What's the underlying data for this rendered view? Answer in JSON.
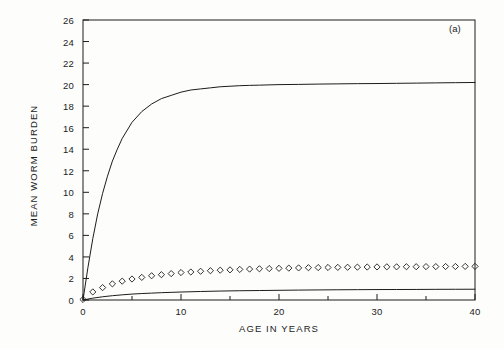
{
  "figure": {
    "panel_label": "(a)",
    "background_color": "#fdfdfc",
    "line_color": "#1c1c1c"
  },
  "chart_data": {
    "type": "line",
    "title": "",
    "xlabel": "AGE IN YEARS",
    "ylabel": "MEAN WORM BURDEN",
    "xlim": [
      0,
      40
    ],
    "ylim": [
      0,
      26
    ],
    "grid": false,
    "legend": "none",
    "xticks": [
      0,
      10,
      20,
      30,
      40
    ],
    "xtick_labels": [
      "0",
      "10",
      "20",
      "30",
      "40"
    ],
    "x_minor_ticks": [
      5,
      15,
      25,
      35
    ],
    "yticks": [
      0,
      2,
      4,
      6,
      8,
      10,
      12,
      14,
      16,
      18,
      20,
      22,
      24,
      26
    ],
    "ytick_labels": [
      "0",
      "2",
      "4",
      "6",
      "8",
      "10",
      "12",
      "14",
      "16",
      "18",
      "20",
      "22",
      "24",
      "26"
    ],
    "series": [
      {
        "name": "upper-saturating-curve",
        "style": "line",
        "x": [
          0,
          0.5,
          1,
          1.5,
          2,
          2.5,
          3,
          3.5,
          4,
          5,
          6,
          7,
          8,
          9,
          10,
          11,
          12,
          13,
          14,
          15,
          16,
          17,
          18,
          20,
          22,
          24,
          26,
          28,
          30,
          32,
          34,
          36,
          38,
          40
        ],
        "values": [
          0,
          3.0,
          5.7,
          8.0,
          9.9,
          11.5,
          12.9,
          14.0,
          15.0,
          16.5,
          17.5,
          18.2,
          18.7,
          19.0,
          19.3,
          19.5,
          19.6,
          19.7,
          19.8,
          19.85,
          19.9,
          19.93,
          19.95,
          20.0,
          20.02,
          20.05,
          20.07,
          20.09,
          20.1,
          20.12,
          20.14,
          20.16,
          20.18,
          20.2
        ]
      },
      {
        "name": "diamond-marker-series",
        "style": "markers",
        "marker": "diamond",
        "x": [
          0,
          1,
          2,
          3,
          4,
          5,
          6,
          7,
          8,
          9,
          10,
          11,
          12,
          13,
          14,
          15,
          16,
          17,
          18,
          19,
          20,
          21,
          22,
          23,
          24,
          25,
          26,
          27,
          28,
          29,
          30,
          31,
          32,
          33,
          34,
          35,
          36,
          37,
          38,
          39,
          40
        ],
        "values": [
          0.05,
          0.75,
          1.15,
          1.5,
          1.75,
          1.95,
          2.1,
          2.25,
          2.35,
          2.45,
          2.55,
          2.6,
          2.67,
          2.72,
          2.77,
          2.8,
          2.84,
          2.87,
          2.9,
          2.92,
          2.94,
          2.96,
          2.98,
          3.0,
          3.01,
          3.02,
          3.03,
          3.04,
          3.05,
          3.06,
          3.07,
          3.08,
          3.08,
          3.09,
          3.09,
          3.1,
          3.1,
          3.11,
          3.11,
          3.12,
          3.12
        ]
      },
      {
        "name": "lower-saturating-curve",
        "style": "line",
        "x": [
          0,
          1,
          2,
          3,
          4,
          5,
          6,
          7,
          8,
          9,
          10,
          12,
          14,
          16,
          18,
          20,
          22,
          24,
          26,
          28,
          30,
          32,
          34,
          36,
          38,
          40
        ],
        "values": [
          0,
          0.17,
          0.3,
          0.4,
          0.48,
          0.55,
          0.6,
          0.64,
          0.68,
          0.71,
          0.74,
          0.79,
          0.83,
          0.86,
          0.88,
          0.9,
          0.92,
          0.935,
          0.95,
          0.96,
          0.97,
          0.975,
          0.98,
          0.99,
          0.995,
          1.0
        ]
      }
    ]
  }
}
